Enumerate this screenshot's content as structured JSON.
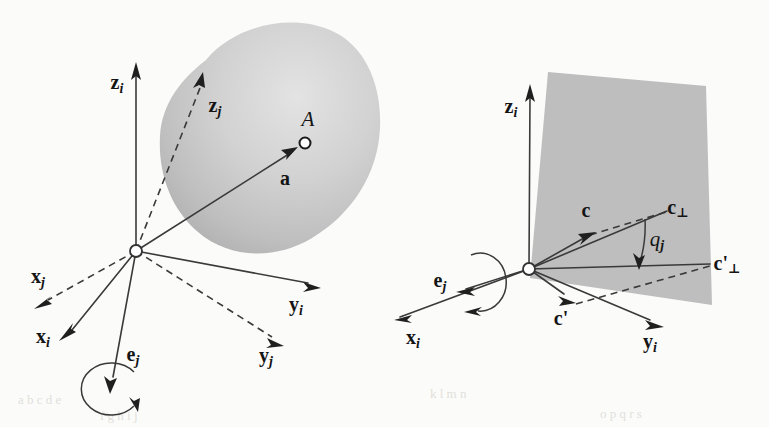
{
  "figure": {
    "domain": "Diagram",
    "background_color": "#fbfbfa",
    "ink_color": "#3a3a3a",
    "shape_fill_color": "#b9b9b9",
    "width": 769,
    "height": 427
  },
  "left_panel": {
    "name": "body-with-point-A",
    "origin_label": "",
    "labels": {
      "z_i": {
        "text": "z",
        "sub": "i"
      },
      "z_j": {
        "text": "z",
        "sub": "j"
      },
      "x_i": {
        "text": "x",
        "sub": "i"
      },
      "x_j": {
        "text": "x",
        "sub": "j"
      },
      "y_i": {
        "text": "y",
        "sub": "i"
      },
      "y_j": {
        "text": "y",
        "sub": "j"
      },
      "e_j": {
        "text": "e",
        "sub": "j"
      },
      "a": {
        "text": "a",
        "sub": ""
      },
      "A": {
        "text": "A",
        "sub": ""
      }
    },
    "body_shape": "egg-blob",
    "rotation_indicator": "circular-arrow-ccw"
  },
  "right_panel": {
    "name": "rotation-of-vector-c-about-e-j",
    "labels": {
      "z_i": {
        "text": "z",
        "sub": "i"
      },
      "x_i": {
        "text": "x",
        "sub": "i"
      },
      "y_i": {
        "text": "y",
        "sub": "i"
      },
      "e_j": {
        "text": "e",
        "sub": "j"
      },
      "c": {
        "text": "c",
        "sub": ""
      },
      "c_prime": {
        "text": "c'",
        "sub": ""
      },
      "c_perp": {
        "text": "c",
        "sub": "",
        "perp": "⊥"
      },
      "c_prime_perp": {
        "text": "c'",
        "sub": "",
        "perp": "⊥"
      },
      "q_j": {
        "text": "q",
        "sub": "j"
      }
    },
    "plane_shape": "rotation-plane-quad",
    "rotation_indicator": "circular-arrow-ccw",
    "angle_arc": "q_j"
  },
  "scan_artifacts": {
    "row1": "a  b c  d   e",
    "row2": "f  g h   i   j",
    "row3": "k   l  m  n",
    "row4": "o p   q  r  s"
  }
}
